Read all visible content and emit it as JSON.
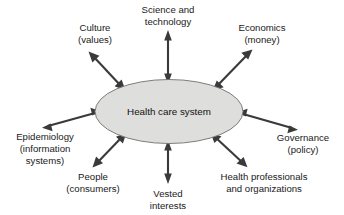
{
  "diagram": {
    "type": "radial-hub-and-spoke",
    "background_color": "#ffffff",
    "center": {
      "label_line1": "Health care system",
      "shape": "ellipse",
      "fill_color": "#dededc",
      "stroke_color": "#6f6f6f"
    },
    "connector": {
      "style": "double-headed-arrow",
      "color": "#3a3a3a",
      "count": 8
    },
    "nodes": [
      {
        "id": "science-and-technology",
        "line1": "Science and",
        "line2": "technology",
        "line3": "",
        "position": "top"
      },
      {
        "id": "economics",
        "line1": "Economics",
        "line2": "(money)",
        "line3": "",
        "position": "top-right"
      },
      {
        "id": "governance",
        "line1": "Governance",
        "line2": "(policy)",
        "line3": "",
        "position": "right"
      },
      {
        "id": "health-professionals-and-organizations",
        "line1": "Health professionals",
        "line2": "and organizations",
        "line3": "",
        "position": "bottom-right"
      },
      {
        "id": "vested-interests",
        "line1": "Vested",
        "line2": "interests",
        "line3": "",
        "position": "bottom"
      },
      {
        "id": "people",
        "line1": "People",
        "line2": "(consumers)",
        "line3": "",
        "position": "bottom-left"
      },
      {
        "id": "epidemiology",
        "line1": "Epidemiology",
        "line2": "(information",
        "line3": "systems)",
        "position": "left"
      },
      {
        "id": "culture",
        "line1": "Culture",
        "line2": "(values)",
        "line3": "",
        "position": "top-left"
      }
    ]
  }
}
